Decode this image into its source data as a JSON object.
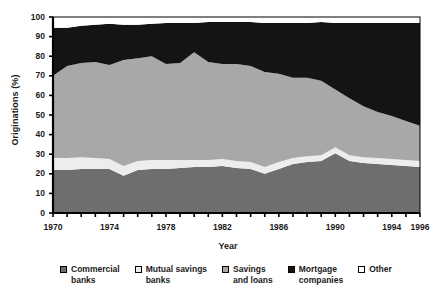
{
  "chart_data": {
    "type": "area",
    "stacked": true,
    "title": "",
    "xlabel": "Year",
    "ylabel": "Originations (%)",
    "xlim": [
      1970,
      1996
    ],
    "ylim": [
      0,
      100
    ],
    "grid": false,
    "legend_position": "bottom",
    "x": [
      1970,
      1971,
      1972,
      1973,
      1974,
      1975,
      1976,
      1977,
      1978,
      1979,
      1980,
      1981,
      1982,
      1983,
      1984,
      1985,
      1986,
      1987,
      1988,
      1989,
      1990,
      1991,
      1992,
      1993,
      1994,
      1995,
      1996
    ],
    "x_tick_labels": [
      "1970",
      "1974",
      "1978",
      "1982",
      "1986",
      "1990",
      "1994",
      "1996"
    ],
    "x_tick_values": [
      1970,
      1974,
      1978,
      1982,
      1986,
      1990,
      1994,
      1996
    ],
    "y_tick_labels": [
      "0",
      "10",
      "20",
      "30",
      "40",
      "50",
      "60",
      "70",
      "80",
      "90",
      "100"
    ],
    "y_tick_values": [
      0,
      10,
      20,
      30,
      40,
      50,
      60,
      70,
      80,
      90,
      100
    ],
    "series": [
      {
        "name": "Commercial banks",
        "color": "#6e6e6e",
        "values": [
          22.0,
          22.0,
          22.5,
          22.5,
          22.5,
          19.0,
          22.0,
          22.5,
          22.5,
          23.0,
          23.5,
          23.5,
          24.0,
          23.0,
          22.5,
          20.0,
          22.5,
          25.0,
          26.0,
          26.5,
          30.5,
          26.5,
          25.5,
          25.0,
          24.5,
          24.0,
          23.5
        ]
      },
      {
        "name": "Mutual savings banks",
        "color": "#ededed",
        "values": [
          6.0,
          6.0,
          6.0,
          5.5,
          5.0,
          5.0,
          4.5,
          4.5,
          4.5,
          4.0,
          3.5,
          3.5,
          3.5,
          3.5,
          3.5,
          3.5,
          3.5,
          3.0,
          3.0,
          3.0,
          3.0,
          3.0,
          3.0,
          3.0,
          3.0,
          3.0,
          3.0
        ]
      },
      {
        "name": "Savings and loans",
        "color": "#a8a8a8",
        "values": [
          42.0,
          47.0,
          48.0,
          49.0,
          48.0,
          54.0,
          52.5,
          53.0,
          49.0,
          49.5,
          55.0,
          50.0,
          48.5,
          49.5,
          49.0,
          48.5,
          45.0,
          41.0,
          40.0,
          38.0,
          29.5,
          29.0,
          26.0,
          23.5,
          22.0,
          20.0,
          18.0
        ]
      },
      {
        "name": "Mortgage companies",
        "color": "#141414",
        "values": [
          24.5,
          19.5,
          19.0,
          19.0,
          21.0,
          18.0,
          17.0,
          16.5,
          21.0,
          20.5,
          15.0,
          20.5,
          21.5,
          21.5,
          22.5,
          25.0,
          26.0,
          28.0,
          28.0,
          30.0,
          34.0,
          38.5,
          42.5,
          45.5,
          47.5,
          50.0,
          52.5
        ]
      },
      {
        "name": "Other",
        "color": "#ffffff",
        "values": [
          5.5,
          5.5,
          4.5,
          4.0,
          3.5,
          4.0,
          4.0,
          3.5,
          3.0,
          3.0,
          3.0,
          2.5,
          2.5,
          2.5,
          2.5,
          3.0,
          3.0,
          3.0,
          3.0,
          2.5,
          3.0,
          3.0,
          3.0,
          3.0,
          3.0,
          3.0,
          3.0
        ]
      }
    ]
  },
  "legend": {
    "items": [
      {
        "label": "Commercial\nbanks",
        "color": "#6e6e6e"
      },
      {
        "label": "Mutual savings\nbanks",
        "color": "#ededed"
      },
      {
        "label": "Savings\nand loans",
        "color": "#a8a8a8"
      },
      {
        "label": "Mortgage\ncompanies",
        "color": "#141414"
      },
      {
        "label": "Other",
        "color": "#ffffff"
      }
    ]
  }
}
